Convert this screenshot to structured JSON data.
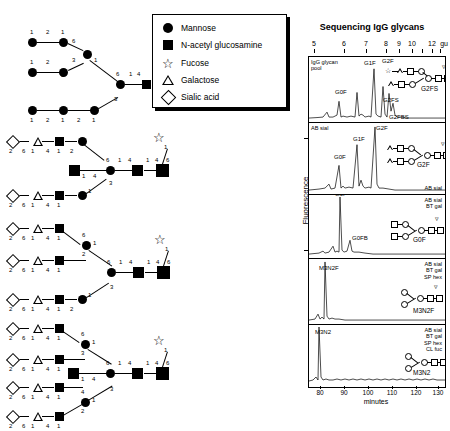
{
  "legend": {
    "title": "glycan-symbol-key",
    "items": [
      {
        "symbol": "mannose",
        "label": "Mannose"
      },
      {
        "symbol": "n-acetyl-glucosamine",
        "label": "N-acetyl glucosamine"
      },
      {
        "symbol": "fucose",
        "label": "Fucose"
      },
      {
        "symbol": "galactose",
        "label": "Galactose"
      },
      {
        "symbol": "sialic-acid",
        "label": "Sialic acid"
      }
    ]
  },
  "structures": [
    {
      "name": "oligomannose-structure",
      "linkage_numbers": [
        "1",
        "2",
        "1",
        "6",
        "3",
        "1",
        "1",
        "2",
        "1",
        "6",
        "1",
        "4",
        "1",
        "4",
        "3",
        "1",
        "2",
        "1",
        "2",
        "1"
      ]
    },
    {
      "name": "biantennary-bisected-sialylated-structure",
      "linkage_numbers": [
        "2",
        "6",
        "1",
        "4",
        "1",
        "2",
        "6",
        "1",
        "4",
        "1",
        "4",
        "1",
        "4",
        "6",
        "3",
        "1",
        "2",
        "6",
        "1",
        "4",
        "1",
        "2",
        "1"
      ]
    },
    {
      "name": "triantennary-sialylated-structure",
      "linkage_numbers": [
        "2",
        "6",
        "1",
        "4",
        "1",
        "6",
        "1",
        "2",
        "2",
        "6",
        "1",
        "4",
        "1",
        "6",
        "1",
        "4",
        "1",
        "4",
        "6",
        "3",
        "2",
        "6",
        "1",
        "4",
        "1",
        "2",
        "1"
      ]
    },
    {
      "name": "tetraantennary-bisected-sialylated-structure",
      "linkage_numbers": [
        "2",
        "6",
        "1",
        "4",
        "1",
        "6",
        "1",
        "3",
        "2",
        "6",
        "1",
        "4",
        "1",
        "4",
        "1",
        "4",
        "6",
        "3",
        "1",
        "4",
        "2",
        "6",
        "1",
        "4",
        "1",
        "2",
        "1",
        "2",
        "6",
        "1",
        "4",
        "1"
      ]
    }
  ],
  "chromatogram": {
    "title": "Sequencing IgG glycans",
    "gu_axis": {
      "unit": "gu",
      "ticks": [
        {
          "label": "5",
          "value": 5
        },
        {
          "label": "6",
          "value": 6
        },
        {
          "label": "7",
          "value": 7
        },
        {
          "label": "8",
          "value": 8
        },
        {
          "label": "9",
          "value": 9
        },
        {
          "label": "10",
          "value": 10
        },
        {
          "label": "",
          "value": 11
        },
        {
          "label": "12",
          "value": 12
        },
        {
          "label": "",
          "value": 13
        }
      ]
    },
    "y_axis_label": "Fluorescence",
    "x_axis": {
      "unit": "minutes",
      "ticks": [
        "80",
        "90",
        "100",
        "110",
        "120",
        "130"
      ]
    },
    "panels": [
      {
        "name": "panel-igg-glycan-pool",
        "condition_left": "IgG glycan\npool",
        "condition_right": "",
        "peaks": [
          {
            "label": "G0F",
            "x_pct": 22,
            "height_pct": 46
          },
          {
            "label": "G1F",
            "x_pct": 38,
            "height_pct": 92
          },
          {
            "label": "G2F",
            "x_pct": 50,
            "height_pct": 96
          },
          {
            "label": "G2FS",
            "x_pct": 56,
            "height_pct": 56
          },
          {
            "label": "G2FBS",
            "x_pct": 61,
            "height_pct": 30
          }
        ],
        "cartoon_label": "G2FS"
      },
      {
        "name": "panel-ab-sial",
        "condition_left": "AB sial",
        "condition_right": "AB sial",
        "peaks": [
          {
            "label": "G0F",
            "x_pct": 22,
            "height_pct": 40
          },
          {
            "label": "G1F",
            "x_pct": 36,
            "height_pct": 70
          },
          {
            "label": "G2F",
            "x_pct": 49,
            "height_pct": 95
          }
        ],
        "cartoon_label": "G2F"
      },
      {
        "name": "panel-ab-sial-bt-gal",
        "condition_left": "",
        "condition_right": "AB sial\nBT gal",
        "peaks": [
          {
            "label": "G0F",
            "x_pct": 23,
            "height_pct": 97
          },
          {
            "label": "G0FB",
            "x_pct": 31,
            "height_pct": 24
          }
        ],
        "cartoon_label": "G0F"
      },
      {
        "name": "panel-ab-sial-bt-gal-sp-hex",
        "condition_left": "",
        "condition_right": "AB sial\nBT gal\nSP hex",
        "peaks": [
          {
            "label": "M3N2F",
            "x_pct": 12,
            "height_pct": 95
          }
        ],
        "cartoon_label": "M3N2F"
      },
      {
        "name": "panel-ab-sial-bt-gal-sp-hex-cl-fuc",
        "condition_left": "",
        "condition_right": "AB sial\nBT gal\nSP hex\nCL fuc",
        "peaks": [
          {
            "label": "M3N2",
            "x_pct": 7,
            "height_pct": 95
          }
        ],
        "cartoon_label": "M3N2"
      }
    ]
  }
}
